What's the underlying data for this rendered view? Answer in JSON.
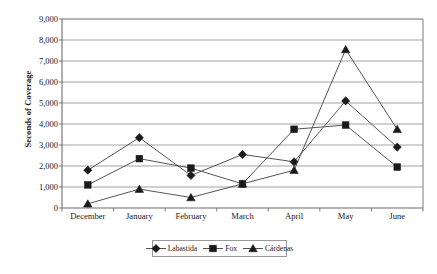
{
  "chart_data": {
    "type": "line",
    "title": "",
    "xlabel": "",
    "ylabel": "Seconds of Coverage",
    "categories": [
      "December",
      "January",
      "February",
      "March",
      "April",
      "May",
      "June"
    ],
    "series": [
      {
        "name": "Labastida",
        "marker": "diamond",
        "values": [
          1800,
          3350,
          1550,
          2550,
          2200,
          5100,
          2900
        ]
      },
      {
        "name": "Fox",
        "marker": "square",
        "values": [
          1100,
          2350,
          1900,
          1150,
          3750,
          3950,
          1950
        ]
      },
      {
        "name": "Cárdenas",
        "marker": "triangle",
        "values": [
          200,
          900,
          500,
          1150,
          1800,
          7550,
          3750
        ]
      }
    ],
    "ylim": [
      0,
      9000
    ],
    "ytick_values": [
      0,
      1000,
      2000,
      3000,
      4000,
      5000,
      6000,
      7000,
      8000,
      9000
    ],
    "ytick_labels": [
      "0",
      "1,000",
      "2,000",
      "3,000",
      "4,000",
      "5,000",
      "6,000",
      "7,000",
      "8,000",
      "9,000"
    ],
    "grid": true,
    "grid_axis": "y",
    "legend_position": "bottom",
    "line_color": "#555555",
    "marker_color": "#1a1a1a",
    "grid_color": "#8c8c8c",
    "axis_color": "#6e6e6e",
    "background_color": "#ffffff"
  }
}
